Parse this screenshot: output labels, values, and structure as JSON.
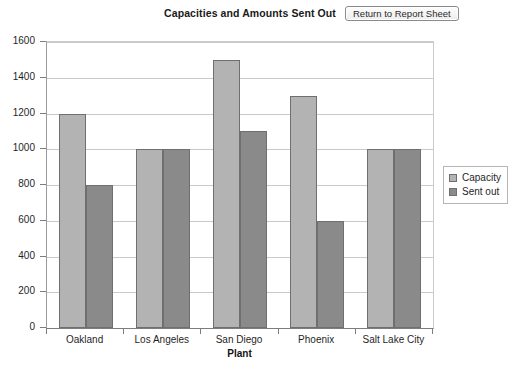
{
  "toolbar": {
    "return_button_label": "Return to Report Sheet"
  },
  "chart_data": {
    "type": "bar",
    "title": "Capacities and Amounts Sent Out",
    "xlabel": "Plant",
    "ylabel": "",
    "categories": [
      "Oakland",
      "Los Angeles",
      "San Diego",
      "Phoenix",
      "Salt Lake City"
    ],
    "series": [
      {
        "name": "Capacity",
        "color": "#b3b3b3",
        "values": [
          1200,
          1000,
          1500,
          1300,
          1000
        ]
      },
      {
        "name": "Sent out",
        "color": "#8a8a8a",
        "values": [
          800,
          1000,
          1100,
          600,
          1000
        ]
      }
    ],
    "ylim": [
      0,
      1600
    ],
    "ytick_step": 200,
    "yticks": [
      0,
      200,
      400,
      600,
      800,
      1000,
      1200,
      1400,
      1600
    ],
    "ytick_labels": [
      "0",
      "200",
      "400",
      "600",
      "800",
      "1000",
      "1200",
      "1400",
      "1600"
    ],
    "grid": true,
    "legend_position": "right"
  }
}
